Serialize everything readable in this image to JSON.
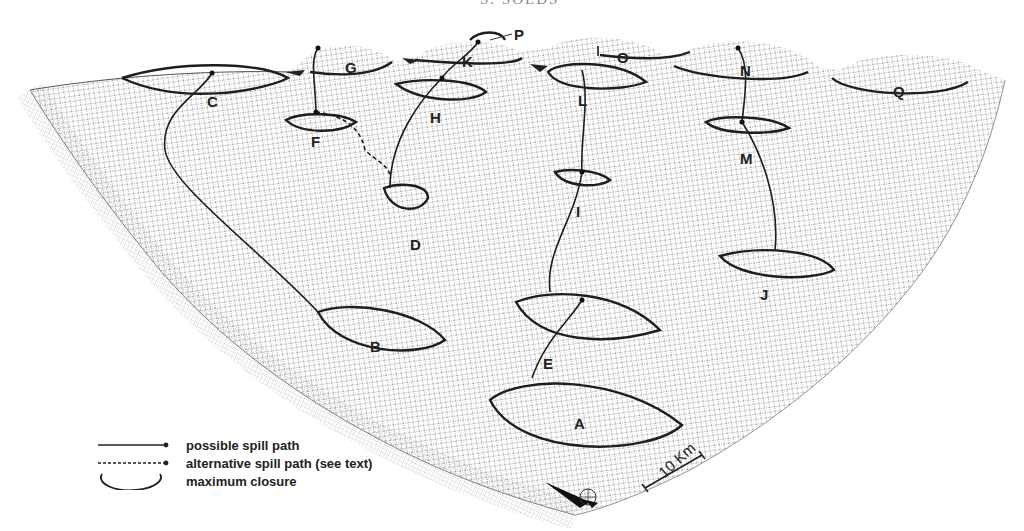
{
  "header": {
    "text": "S. SOLDS"
  },
  "diagram": {
    "type": "3D wireframe surface of structural closures with spill paths",
    "closures": [
      {
        "id": "A",
        "label": "A"
      },
      {
        "id": "B",
        "label": "B"
      },
      {
        "id": "C",
        "label": "C"
      },
      {
        "id": "D",
        "label": "D"
      },
      {
        "id": "E",
        "label": "E"
      },
      {
        "id": "F",
        "label": "F"
      },
      {
        "id": "G",
        "label": "G"
      },
      {
        "id": "H",
        "label": "H"
      },
      {
        "id": "I",
        "label": "I"
      },
      {
        "id": "J",
        "label": "J"
      },
      {
        "id": "K",
        "label": "K"
      },
      {
        "id": "L",
        "label": "L"
      },
      {
        "id": "M",
        "label": "M"
      },
      {
        "id": "N",
        "label": "N"
      },
      {
        "id": "O",
        "label": "O"
      },
      {
        "id": "P",
        "label": "P"
      },
      {
        "id": "Q",
        "label": "Q"
      }
    ]
  },
  "legend": {
    "items": [
      {
        "symbol": "solid-line-dot",
        "label": "possible spill path"
      },
      {
        "symbol": "dashed-line-dot",
        "label": "alternative spill path (see text)"
      },
      {
        "symbol": "arc",
        "label": "maximum closure"
      }
    ]
  },
  "scale": {
    "label": "10 Km"
  },
  "north_arrow": {
    "label": "N"
  }
}
